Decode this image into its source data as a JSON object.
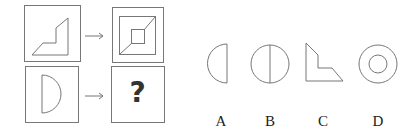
{
  "puzzle": {
    "question_mark": "?",
    "rows": [
      {
        "input_shape": "l-shaped-polygon",
        "arrow": "→",
        "output_shape": "nested-squares-with-diagonal"
      },
      {
        "input_shape": "half-circle-right",
        "arrow": "→",
        "output_shape": "unknown"
      }
    ]
  },
  "options": [
    {
      "label": "A",
      "shape": "half-circle-left"
    },
    {
      "label": "B",
      "shape": "circle-with-vertical-diameter"
    },
    {
      "label": "C",
      "shape": "l-shaped-polygon"
    },
    {
      "label": "D",
      "shape": "concentric-circles"
    }
  ],
  "colors": {
    "stroke": "#6b6b6b",
    "text": "#222222"
  }
}
